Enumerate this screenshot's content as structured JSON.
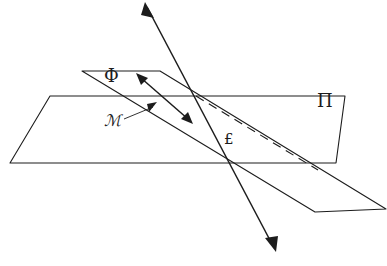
{
  "figure": {
    "background_color": "#ffffff",
    "stroke_color": "#1c1c1c",
    "labels": {
      "plane_phi": "Φ",
      "plane_pi": "Π",
      "manifold_m": "ℳ",
      "point_l": "£"
    },
    "elements": {
      "plane_pi_name": "horizontal-plane",
      "plane_phi_name": "oblique-plane",
      "dashed_line_name": "hidden-intersection-line",
      "transversal_name": "transversal-line",
      "double_arrow_name": "normal-direction-arrow",
      "leader_name": "m-leader-line"
    },
    "geometry": {
      "plane_pi_points": "50,96 345,96 336,163 10,163",
      "plane_phi_points": "82,71 160,71 386,209 315,212",
      "dashed_line": "196,96 316,169",
      "transversal": "146,4 274,248",
      "double_arrow_line": "138,75 191,122",
      "leader_line": "124,118 156,105"
    }
  }
}
